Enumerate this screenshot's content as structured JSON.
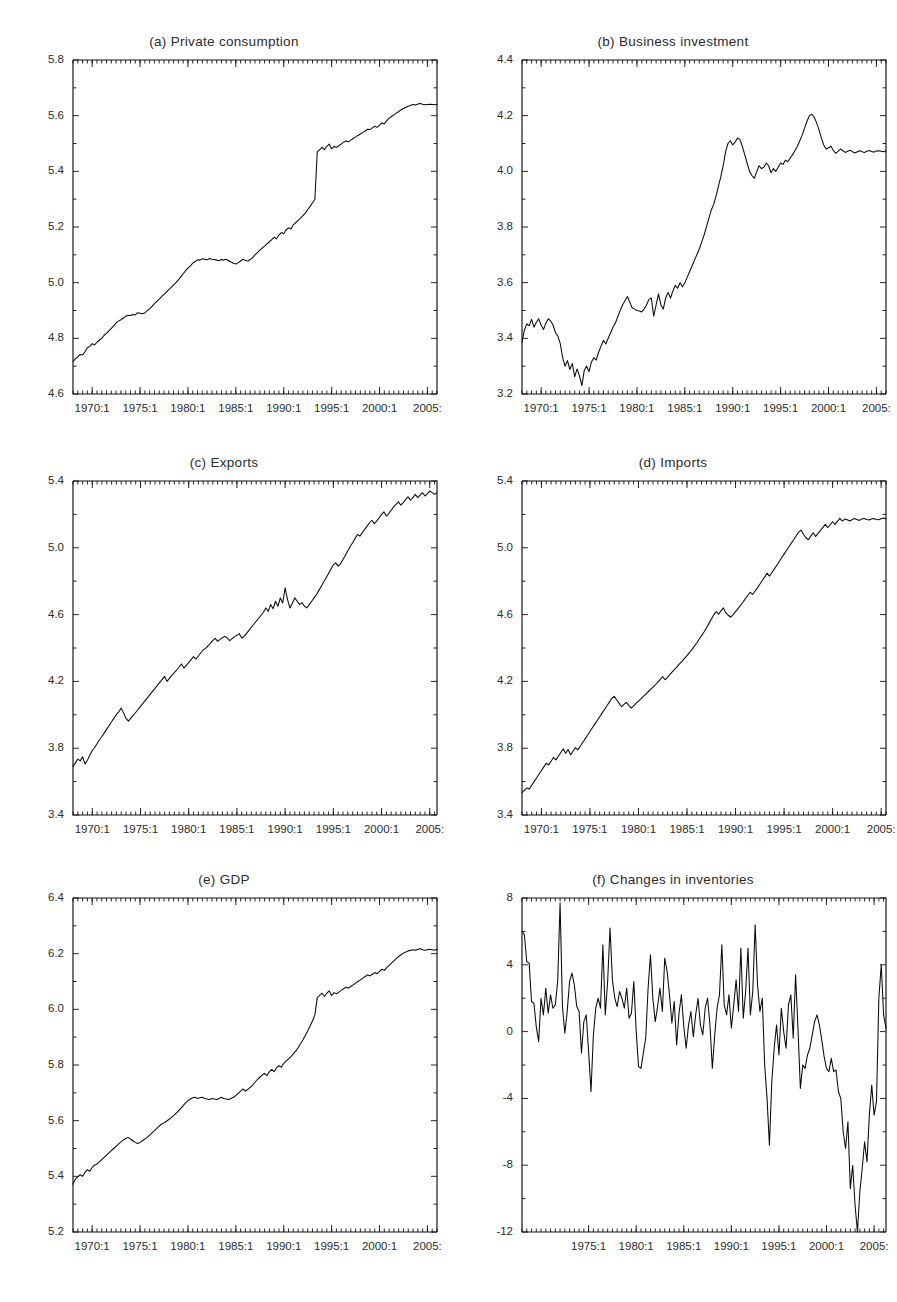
{
  "figure": {
    "background": "#ffffff",
    "line_color": "#0a0a0a",
    "panel_count": 6
  },
  "panels": [
    {
      "id": "a",
      "title": "(a) Private consumption"
    },
    {
      "id": "b",
      "title": "(b) Business investment"
    },
    {
      "id": "c",
      "title": "(c) Exports"
    },
    {
      "id": "d",
      "title": "(d) Imports"
    },
    {
      "id": "e",
      "title": "(e) GDP"
    },
    {
      "id": "f",
      "title": "(f) Changes in inventories"
    }
  ],
  "chart_data": [
    {
      "type": "line",
      "panel": "a",
      "title": "(a) Private consumption",
      "xlabel": "",
      "ylabel": "",
      "grid": false,
      "legend": "none",
      "xlim": [
        "1968:1",
        "2005:4"
      ],
      "ylim": [
        4.6,
        5.8
      ],
      "yticks": [
        "4.6",
        "4.8",
        "5.0",
        "5.2",
        "5.4",
        "5.6",
        "5.8"
      ],
      "xticks": [
        "1970:1",
        "1975:1",
        "1980:1",
        "1985:1",
        "1990:1",
        "1995:1",
        "2000:1",
        "2005:1"
      ],
      "x_start_year": 1968,
      "x_quarters": 152,
      "values": [
        4.716,
        4.727,
        4.733,
        4.742,
        4.74,
        4.752,
        4.766,
        4.771,
        4.781,
        4.776,
        4.786,
        4.793,
        4.8,
        4.811,
        4.818,
        4.827,
        4.836,
        4.845,
        4.856,
        4.862,
        4.867,
        4.873,
        4.879,
        4.883,
        4.882,
        4.886,
        4.884,
        4.892,
        4.89,
        4.888,
        4.891,
        4.9,
        4.906,
        4.915,
        4.925,
        4.933,
        4.941,
        4.95,
        4.958,
        4.966,
        4.975,
        4.983,
        4.992,
        5.0,
        5.01,
        5.021,
        5.032,
        5.043,
        5.052,
        5.06,
        5.07,
        5.076,
        5.082,
        5.081,
        5.086,
        5.084,
        5.082,
        5.087,
        5.084,
        5.083,
        5.081,
        5.079,
        5.083,
        5.081,
        5.084,
        5.079,
        5.074,
        5.07,
        5.067,
        5.072,
        5.078,
        5.084,
        5.08,
        5.078,
        5.083,
        5.09,
        5.1,
        5.108,
        5.117,
        5.124,
        5.131,
        5.139,
        5.147,
        5.155,
        5.163,
        5.158,
        5.172,
        5.18,
        5.176,
        5.19,
        5.197,
        5.193,
        5.208,
        5.216,
        5.224,
        5.232,
        5.241,
        5.25,
        5.262,
        5.274,
        5.286,
        5.3,
        5.47,
        5.478,
        5.486,
        5.478,
        5.49,
        5.498,
        5.481,
        5.49,
        5.486,
        5.492,
        5.498,
        5.505,
        5.509,
        5.506,
        5.512,
        5.518,
        5.523,
        5.529,
        5.534,
        5.54,
        5.545,
        5.551,
        5.55,
        5.556,
        5.562,
        5.558,
        5.566,
        5.574,
        5.57,
        5.582,
        5.591,
        5.597,
        5.603,
        5.609,
        5.615,
        5.621,
        5.626,
        5.63,
        5.634,
        5.637,
        5.64,
        5.638,
        5.642,
        5.644,
        5.641,
        5.639,
        5.64,
        5.641,
        5.64,
        5.639,
        5.641
      ]
    },
    {
      "type": "line",
      "panel": "b",
      "title": "(b) Business investment",
      "xlabel": "",
      "ylabel": "",
      "grid": false,
      "legend": "none",
      "xlim": [
        "1968:1",
        "2005:4"
      ],
      "ylim": [
        3.2,
        4.4
      ],
      "yticks": [
        "3.2",
        "3.4",
        "3.6",
        "3.8",
        "4.0",
        "4.2",
        "4.4"
      ],
      "xticks": [
        "1970:1",
        "1975:1",
        "1980:1",
        "1985:1",
        "1990:1",
        "1995:1",
        "2000:1",
        "2005:1"
      ],
      "x_start_year": 1968,
      "x_quarters": 152,
      "values": [
        3.385,
        3.43,
        3.452,
        3.445,
        3.468,
        3.44,
        3.458,
        3.47,
        3.447,
        3.432,
        3.455,
        3.47,
        3.462,
        3.447,
        3.42,
        3.408,
        3.38,
        3.33,
        3.3,
        3.32,
        3.288,
        3.31,
        3.262,
        3.29,
        3.265,
        3.23,
        3.285,
        3.3,
        3.28,
        3.315,
        3.33,
        3.322,
        3.35,
        3.372,
        3.392,
        3.38,
        3.4,
        3.42,
        3.44,
        3.455,
        3.478,
        3.5,
        3.52,
        3.535,
        3.55,
        3.53,
        3.51,
        3.505,
        3.5,
        3.498,
        3.495,
        3.505,
        3.52,
        3.54,
        3.545,
        3.48,
        3.52,
        3.56,
        3.52,
        3.505,
        3.545,
        3.565,
        3.545,
        3.57,
        3.59,
        3.58,
        3.6,
        3.585,
        3.6,
        3.62,
        3.64,
        3.66,
        3.68,
        3.7,
        3.72,
        3.745,
        3.77,
        3.8,
        3.83,
        3.86,
        3.88,
        3.91,
        3.945,
        3.98,
        4.02,
        4.07,
        4.1,
        4.11,
        4.095,
        4.105,
        4.12,
        4.115,
        4.09,
        4.06,
        4.03,
        4.0,
        3.985,
        3.975,
        3.998,
        4.02,
        4.01,
        4.015,
        4.03,
        4.02,
        3.995,
        4.01,
        4.0,
        4.015,
        4.03,
        4.025,
        4.04,
        4.035,
        4.048,
        4.06,
        4.075,
        4.09,
        4.11,
        4.13,
        4.155,
        4.18,
        4.2,
        4.205,
        4.195,
        4.175,
        4.15,
        4.12,
        4.095,
        4.08,
        4.085,
        4.09,
        4.075,
        4.065,
        4.072,
        4.08,
        4.074,
        4.068,
        4.072,
        4.076,
        4.07,
        4.066,
        4.07,
        4.074,
        4.07,
        4.068,
        4.072,
        4.075,
        4.071,
        4.069,
        4.073,
        4.074,
        4.072,
        4.07,
        4.073
      ]
    },
    {
      "type": "line",
      "panel": "c",
      "title": "(c) Exports",
      "xlabel": "",
      "ylabel": "",
      "grid": false,
      "legend": "none",
      "xlim": [
        "1968:1",
        "2005:4"
      ],
      "ylim": [
        3.4,
        5.4
      ],
      "yticks": [
        "3.4",
        "3.8",
        "4.2",
        "4.6",
        "5.0",
        "5.4"
      ],
      "xticks": [
        "1970:1",
        "1975:1",
        "1980:1",
        "1985:1",
        "1990:1",
        "1995:1",
        "2000:1",
        "2005:1"
      ],
      "x_start_year": 1968,
      "x_quarters": 152,
      "values": [
        3.69,
        3.712,
        3.735,
        3.724,
        3.748,
        3.706,
        3.728,
        3.76,
        3.786,
        3.804,
        3.828,
        3.852,
        3.87,
        3.892,
        3.914,
        3.936,
        3.958,
        3.98,
        4.002,
        4.018,
        4.04,
        4.01,
        3.978,
        3.962,
        3.98,
        3.996,
        4.014,
        4.032,
        4.05,
        4.068,
        4.086,
        4.104,
        4.122,
        4.14,
        4.158,
        4.176,
        4.194,
        4.212,
        4.23,
        4.2,
        4.218,
        4.236,
        4.252,
        4.268,
        4.286,
        4.304,
        4.28,
        4.296,
        4.312,
        4.33,
        4.348,
        4.334,
        4.352,
        4.37,
        4.388,
        4.398,
        4.412,
        4.428,
        4.446,
        4.458,
        4.44,
        4.452,
        4.462,
        4.47,
        4.46,
        4.444,
        4.456,
        4.468,
        4.476,
        4.486,
        4.46,
        4.47,
        4.488,
        4.506,
        4.524,
        4.542,
        4.56,
        4.578,
        4.596,
        4.614,
        4.64,
        4.62,
        4.66,
        4.635,
        4.68,
        4.65,
        4.7,
        4.67,
        4.76,
        4.69,
        4.64,
        4.67,
        4.7,
        4.68,
        4.66,
        4.672,
        4.65,
        4.64,
        4.66,
        4.68,
        4.7,
        4.72,
        4.745,
        4.77,
        4.795,
        4.82,
        4.846,
        4.872,
        4.898,
        4.91,
        4.89,
        4.905,
        4.93,
        4.956,
        4.982,
        5.008,
        5.03,
        5.055,
        5.08,
        5.07,
        5.09,
        5.11,
        5.13,
        5.15,
        5.165,
        5.145,
        5.16,
        5.18,
        5.2,
        5.215,
        5.19,
        5.205,
        5.225,
        5.245,
        5.26,
        5.275,
        5.255,
        5.27,
        5.29,
        5.305,
        5.285,
        5.3,
        5.32,
        5.3,
        5.315,
        5.33,
        5.31,
        5.325,
        5.34,
        5.33,
        5.32,
        5.33
      ]
    },
    {
      "type": "line",
      "panel": "d",
      "title": "(d) Imports",
      "xlabel": "",
      "ylabel": "",
      "grid": false,
      "legend": "none",
      "xlim": [
        "1968:1",
        "2005:4"
      ],
      "ylim": [
        3.4,
        5.4
      ],
      "yticks": [
        "3.4",
        "3.8",
        "4.2",
        "4.6",
        "5.0",
        "5.4"
      ],
      "xticks": [
        "1970:1",
        "1975:1",
        "1980:1",
        "1985:1",
        "1990:1",
        "1995:1",
        "2000:1",
        "2005:1"
      ],
      "x_start_year": 1968,
      "x_quarters": 152,
      "values": [
        3.534,
        3.548,
        3.562,
        3.556,
        3.578,
        3.6,
        3.622,
        3.644,
        3.666,
        3.688,
        3.71,
        3.7,
        3.722,
        3.744,
        3.73,
        3.752,
        3.774,
        3.796,
        3.77,
        3.792,
        3.76,
        3.782,
        3.804,
        3.79,
        3.812,
        3.834,
        3.856,
        3.878,
        3.9,
        3.922,
        3.944,
        3.966,
        3.988,
        4.01,
        4.032,
        4.054,
        4.076,
        4.098,
        4.11,
        4.09,
        4.07,
        4.048,
        4.062,
        4.074,
        4.056,
        4.04,
        4.054,
        4.068,
        4.082,
        4.096,
        4.11,
        4.124,
        4.138,
        4.152,
        4.166,
        4.18,
        4.196,
        4.212,
        4.228,
        4.21,
        4.226,
        4.242,
        4.258,
        4.274,
        4.29,
        4.306,
        4.322,
        4.338,
        4.354,
        4.372,
        4.39,
        4.41,
        4.43,
        4.452,
        4.474,
        4.496,
        4.52,
        4.546,
        4.572,
        4.598,
        4.618,
        4.602,
        4.622,
        4.64,
        4.61,
        4.596,
        4.584,
        4.6,
        4.618,
        4.636,
        4.654,
        4.674,
        4.694,
        4.714,
        4.734,
        4.72,
        4.74,
        4.76,
        4.782,
        4.804,
        4.826,
        4.848,
        4.83,
        4.852,
        4.874,
        4.896,
        4.918,
        4.94,
        4.962,
        4.984,
        5.006,
        5.028,
        5.05,
        5.072,
        5.094,
        5.106,
        5.08,
        5.06,
        5.048,
        5.07,
        5.09,
        5.068,
        5.086,
        5.104,
        5.122,
        5.14,
        5.12,
        5.138,
        5.156,
        5.14,
        5.158,
        5.176,
        5.16,
        5.172,
        5.168,
        5.16,
        5.168,
        5.176,
        5.17,
        5.164,
        5.172,
        5.176,
        5.17,
        5.166,
        5.172,
        5.176,
        5.17,
        5.168,
        5.174,
        5.178,
        5.172
      ]
    },
    {
      "type": "line",
      "panel": "e",
      "title": "(e) GDP",
      "xlabel": "",
      "ylabel": "",
      "grid": false,
      "legend": "none",
      "xlim": [
        "1968:1",
        "2005:4"
      ],
      "ylim": [
        5.2,
        6.4
      ],
      "yticks": [
        "5.2",
        "5.4",
        "5.6",
        "5.8",
        "6.0",
        "6.2",
        "6.4"
      ],
      "xticks": [
        "1970:1",
        "1975:1",
        "1980:1",
        "1985:1",
        "1990:1",
        "1995:1",
        "2000:1",
        "2005:1"
      ],
      "x_start_year": 1968,
      "x_quarters": 152,
      "values": [
        5.372,
        5.39,
        5.398,
        5.406,
        5.4,
        5.414,
        5.424,
        5.418,
        5.432,
        5.44,
        5.444,
        5.452,
        5.46,
        5.468,
        5.476,
        5.484,
        5.492,
        5.5,
        5.508,
        5.516,
        5.524,
        5.53,
        5.536,
        5.54,
        5.534,
        5.528,
        5.522,
        5.518,
        5.522,
        5.528,
        5.534,
        5.54,
        5.548,
        5.556,
        5.564,
        5.572,
        5.58,
        5.588,
        5.592,
        5.598,
        5.604,
        5.61,
        5.618,
        5.626,
        5.634,
        5.644,
        5.654,
        5.664,
        5.672,
        5.678,
        5.682,
        5.684,
        5.68,
        5.682,
        5.684,
        5.68,
        5.678,
        5.676,
        5.68,
        5.678,
        5.676,
        5.68,
        5.684,
        5.68,
        5.678,
        5.676,
        5.68,
        5.684,
        5.69,
        5.698,
        5.706,
        5.714,
        5.706,
        5.712,
        5.72,
        5.728,
        5.738,
        5.748,
        5.756,
        5.764,
        5.77,
        5.762,
        5.776,
        5.784,
        5.776,
        5.79,
        5.798,
        5.792,
        5.806,
        5.814,
        5.822,
        5.83,
        5.84,
        5.85,
        5.862,
        5.876,
        5.89,
        5.906,
        5.922,
        5.94,
        5.958,
        5.98,
        6.042,
        6.05,
        6.058,
        6.046,
        6.058,
        6.066,
        6.05,
        6.06,
        6.056,
        6.062,
        6.068,
        6.074,
        6.08,
        6.076,
        6.082,
        6.088,
        6.094,
        6.1,
        6.106,
        6.112,
        6.118,
        6.124,
        6.12,
        6.126,
        6.132,
        6.128,
        6.136,
        6.144,
        6.14,
        6.15,
        6.158,
        6.166,
        6.174,
        6.182,
        6.19,
        6.196,
        6.202,
        6.206,
        6.21,
        6.212,
        6.214,
        6.212,
        6.216,
        6.218,
        6.214,
        6.212,
        6.214,
        6.216,
        6.214,
        6.212,
        6.216
      ]
    },
    {
      "type": "line",
      "panel": "f",
      "title": "(f) Changes in inventories",
      "xlabel": "",
      "ylabel": "",
      "grid": false,
      "legend": "none",
      "xlim": [
        "1968:1",
        "2005:4"
      ],
      "ylim": [
        -12,
        8
      ],
      "yticks": [
        "-12",
        "-8",
        "-4",
        "0",
        "4",
        "8"
      ],
      "xticks": [
        "1975:1",
        "1980:1",
        "1985:1",
        "1990:1",
        "1995:1",
        "2000:1",
        "2005:1"
      ],
      "x_start_year": 1968,
      "x_quarters": 152,
      "values": [
        6.0,
        5.8,
        4.2,
        4.1,
        1.8,
        1.7,
        0.3,
        -0.6,
        2.0,
        1.0,
        2.6,
        1.1,
        2.2,
        1.4,
        1.6,
        3.0,
        7.7,
        1.5,
        -0.1,
        1.2,
        3.0,
        3.5,
        2.8,
        1.5,
        1.2,
        -1.3,
        0.6,
        1.0,
        -1.2,
        -3.6,
        -0.2,
        1.4,
        2.0,
        1.4,
        5.2,
        1.0,
        3.0,
        6.2,
        3.1,
        2.0,
        1.5,
        2.4,
        2.0,
        1.4,
        2.6,
        0.8,
        1.1,
        3.0,
        0.0,
        -2.1,
        -2.2,
        -1.3,
        -0.4,
        2.6,
        4.6,
        2.0,
        0.6,
        1.5,
        2.6,
        1.2,
        4.4,
        3.6,
        2.2,
        0.5,
        1.8,
        -0.8,
        1.1,
        2.2,
        0.3,
        -1.0,
        0.4,
        1.2,
        -0.3,
        1.0,
        2.0,
        0.4,
        -0.2,
        1.4,
        2.0,
        0.4,
        -2.2,
        -0.2,
        1.4,
        2.2,
        5.2,
        1.6,
        1.0,
        2.2,
        0.2,
        1.6,
        3.1,
        1.2,
        5.0,
        0.8,
        2.4,
        5.0,
        1.0,
        2.4,
        6.4,
        2.8,
        1.2,
        2.0,
        -2.0,
        -4.0,
        -6.8,
        -3.0,
        -1.0,
        0.4,
        -1.4,
        1.4,
        0.0,
        -1.0,
        1.6,
        2.2,
        -0.4,
        3.4,
        0.2,
        -3.4,
        -2.0,
        -2.2,
        -1.4,
        -1.0,
        -0.2,
        0.6,
        1.0,
        0.4,
        -0.5,
        -1.5,
        -2.2,
        -2.4,
        -1.6,
        -2.4,
        -2.3,
        -3.6,
        -4.0,
        -6.0,
        -7.0,
        -5.4,
        -9.4,
        -8.0,
        -10.4,
        -12.0,
        -9.6,
        -8.2,
        -6.6,
        -7.8,
        -5.0,
        -3.2,
        -5.0,
        -4.2,
        2.0,
        4.0,
        1.0,
        0.2
      ]
    }
  ]
}
